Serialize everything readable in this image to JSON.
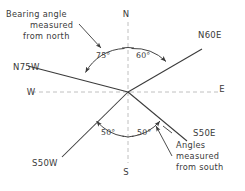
{
  "figure": {
    "type": "compass-bearing-diagram",
    "background": "#ffffff",
    "ink_color": "#3a3a3a",
    "axis_color": "#b9b9b9",
    "origin": {
      "x": 128,
      "y": 92
    }
  },
  "compass": {
    "north_label": "N",
    "south_label": "S",
    "east_label": "E",
    "west_label": "W"
  },
  "bearings": [
    {
      "label": "N60E",
      "angle_from_north_deg": 60,
      "direction": "NE",
      "arc_label": "60°"
    },
    {
      "label": "N75W",
      "angle_from_north_deg": 75,
      "direction": "NW",
      "arc_label": "75°"
    },
    {
      "label": "S50E",
      "angle_from_south_deg": 50,
      "direction": "SE",
      "arc_label": "50°"
    },
    {
      "label": "S50W",
      "angle_from_south_deg": 50,
      "direction": "SW",
      "arc_label": "50°"
    }
  ],
  "angle_labels": {
    "north_west": "75°",
    "north_east": "60°",
    "south_west": "50°",
    "south_east": "50°"
  },
  "annotations": {
    "north_note": {
      "line1": "Bearing angle",
      "line2": "measured",
      "line3": "from north"
    },
    "south_note": {
      "line1": "Angles",
      "line2": "measured",
      "line3": "from south"
    }
  }
}
